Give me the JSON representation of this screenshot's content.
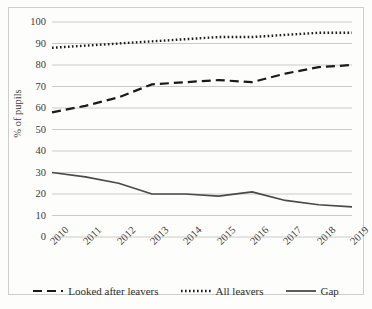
{
  "chart_data": {
    "type": "line",
    "title": "",
    "xlabel": "",
    "ylabel": "% of pupils",
    "x": [
      "2010",
      "2011",
      "2012",
      "2013",
      "2014",
      "2015",
      "2016",
      "2017",
      "2018",
      "2019"
    ],
    "categories": [
      "2010",
      "2011",
      "2012",
      "2013",
      "2014",
      "2015",
      "2016",
      "2017",
      "2018",
      "2019"
    ],
    "ylim": [
      0,
      100
    ],
    "yticks": [
      0,
      10,
      20,
      30,
      40,
      50,
      60,
      70,
      80,
      90,
      100
    ],
    "ytick_labels": [
      "0",
      "10",
      "20",
      "30",
      "40",
      "50",
      "60",
      "70",
      "80",
      "90",
      "100"
    ],
    "grid": true,
    "grid_axis": "y",
    "legend_position": "bottom",
    "series": [
      {
        "name": "Looked after leavers",
        "style": "dashed",
        "color": "#1a1a1a",
        "values": [
          58,
          61,
          65,
          71,
          72,
          73,
          72,
          76,
          79,
          80
        ]
      },
      {
        "name": "All leavers",
        "style": "dotted",
        "color": "#1a1a1a",
        "values": [
          88,
          89,
          90,
          91,
          92,
          93,
          93,
          94,
          95,
          95
        ]
      },
      {
        "name": "Gap",
        "style": "solid",
        "color": "#4a4a4a",
        "values": [
          30,
          28,
          25,
          20,
          20,
          19,
          21,
          17,
          15,
          14
        ]
      }
    ]
  },
  "legend": {
    "items": [
      {
        "label": "Looked after leavers",
        "style": "dashed"
      },
      {
        "label": "All leavers",
        "style": "dotted"
      },
      {
        "label": "Gap",
        "style": "solid"
      }
    ]
  },
  "colors": {
    "plot_background": "#fdfdfc",
    "gridline": "#c4c4c0",
    "frame_border": "#cfcfcb",
    "axis_text": "#3b3b3b",
    "series_dark": "#1a1a1a",
    "series_gap": "#4a4a4a"
  }
}
